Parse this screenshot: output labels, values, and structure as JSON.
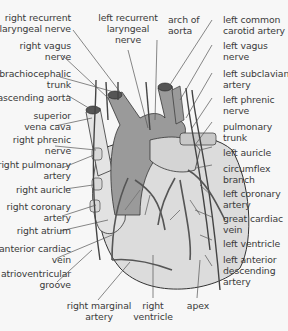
{
  "diagram": {
    "colors": {
      "background": "#f7f7f7",
      "heart_light": "#dcdcdc",
      "aorta_dark": "#9a9a9a",
      "vessel_mid": "#b4b4b4",
      "leader_line": "#555555",
      "text": "#3a3a3a"
    },
    "labels_left": [
      {
        "lines": [
          "right recurrent",
          "laryngeal nerve"
        ]
      },
      {
        "lines": [
          "right vagus",
          "nerve"
        ]
      },
      {
        "lines": [
          "brachiocephalic",
          "trunk"
        ]
      },
      {
        "lines": [
          "ascending aorta"
        ]
      },
      {
        "lines": [
          "superior",
          "vena cava"
        ]
      },
      {
        "lines": [
          "right phrenic",
          "nerve"
        ]
      },
      {
        "lines": [
          "right pulmonary",
          "artery"
        ]
      },
      {
        "lines": [
          "right auricle"
        ]
      },
      {
        "lines": [
          "right coronary",
          "artery"
        ]
      },
      {
        "lines": [
          "right atrium"
        ]
      },
      {
        "lines": [
          "anterior cardiac",
          "vein"
        ]
      },
      {
        "lines": [
          "atrioventricular",
          "groove"
        ]
      }
    ],
    "labels_top": [
      {
        "lines": [
          "left recurrent",
          "laryngeal",
          "nerve"
        ]
      },
      {
        "lines": [
          "arch of",
          "aorta"
        ]
      }
    ],
    "labels_right": [
      {
        "lines": [
          "left common",
          "carotid artery"
        ]
      },
      {
        "lines": [
          "left vagus",
          "nerve"
        ]
      },
      {
        "lines": [
          "left subclavian",
          "artery"
        ]
      },
      {
        "lines": [
          "left phrenic",
          "nerve"
        ]
      },
      {
        "lines": [
          "pulmonary",
          "trunk"
        ]
      },
      {
        "lines": [
          "left auricle"
        ]
      },
      {
        "lines": [
          "circumflex",
          "branch"
        ]
      },
      {
        "lines": [
          "left coronary",
          "artery"
        ]
      },
      {
        "lines": [
          "great cardiac",
          "vein"
        ]
      },
      {
        "lines": [
          "left ventricle"
        ]
      },
      {
        "lines": [
          "left anterior",
          "descending",
          "artery"
        ]
      }
    ],
    "labels_bottom": [
      {
        "lines": [
          "right marginal",
          "artery"
        ]
      },
      {
        "lines": [
          "right",
          "ventricle"
        ]
      },
      {
        "lines": [
          "apex"
        ]
      }
    ]
  }
}
